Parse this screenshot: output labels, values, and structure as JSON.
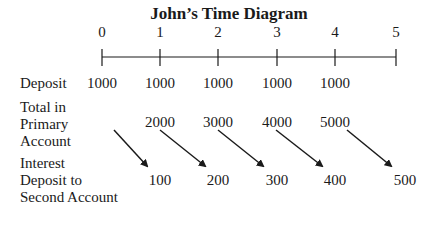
{
  "title": "John’s Time Diagram",
  "timeline": {
    "periods": [
      "0",
      "1",
      "2",
      "3",
      "4",
      "5"
    ]
  },
  "rows": {
    "deposit": {
      "label": "Deposit",
      "values": [
        "1000",
        "1000",
        "1000",
        "1000",
        "1000"
      ]
    },
    "total": {
      "label_lines": [
        "Total in",
        "Primary",
        "Account"
      ],
      "values": [
        "2000",
        "3000",
        "4000",
        "5000"
      ]
    },
    "interest": {
      "label_lines": [
        "Interest",
        "Deposit to",
        "Second Account"
      ],
      "values": [
        "100",
        "200",
        "300",
        "400",
        "500"
      ]
    }
  },
  "colors": {
    "line": "#1a1a1a",
    "text": "#1a1a1a"
  }
}
